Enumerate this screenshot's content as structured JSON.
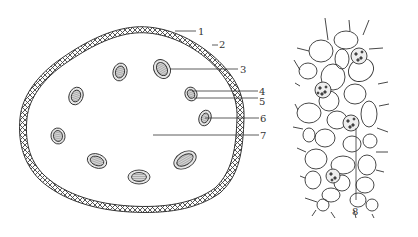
{
  "figure": {
    "left_panel": {
      "name": "plant-cell-diagram",
      "labels": [
        {
          "id": "1",
          "text": "1"
        },
        {
          "id": "2",
          "text": "2"
        },
        {
          "id": "3",
          "text": "3"
        },
        {
          "id": "4",
          "text": "4"
        },
        {
          "id": "5",
          "text": "5"
        },
        {
          "id": "6",
          "text": "6"
        },
        {
          "id": "7",
          "text": "7"
        }
      ]
    },
    "right_panel": {
      "name": "parenchyma-tissue-diagram",
      "labels": [
        {
          "id": "8",
          "text": "8"
        }
      ]
    },
    "caption": "",
    "colors": {
      "line": "#333333",
      "background": "#ffffff",
      "organelle_fill": "#cfcfcf"
    }
  }
}
